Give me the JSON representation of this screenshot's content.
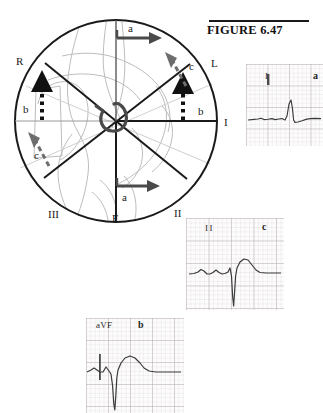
{
  "figure": {
    "title": "FIGURE 6.47"
  },
  "hexaxial": {
    "name": "hexaxial-reference-circle",
    "axis_labels": [
      {
        "id": "R",
        "label": "R",
        "x": 14,
        "y": 56
      },
      {
        "id": "L",
        "label": "L",
        "x": 208,
        "y": 58
      },
      {
        "id": "I",
        "label": "I",
        "x": 222,
        "y": 115
      },
      {
        "id": "II",
        "label": "II",
        "x": 172,
        "y": 207
      },
      {
        "id": "III",
        "label": "III",
        "x": 46,
        "y": 208
      },
      {
        "id": "F",
        "label": "F",
        "x": 110,
        "y": 213
      }
    ],
    "vectors": [
      {
        "id": "a-top",
        "label": "a",
        "style": "solid-arrow-right",
        "x": 128,
        "y": 26
      },
      {
        "id": "a-bottom",
        "label": "a",
        "style": "solid-arrow-right",
        "x": 121,
        "y": 190
      },
      {
        "id": "b-left",
        "label": "b",
        "style": "dotted-arrow-up",
        "x": 21,
        "y": 101
      },
      {
        "id": "b-right",
        "label": "b",
        "style": "dotted-arrow-up",
        "x": 198,
        "y": 103
      },
      {
        "id": "c-left",
        "label": "c",
        "style": "dashed-arrow-up-left",
        "x": 33,
        "y": 146
      },
      {
        "id": "c-right",
        "label": "c",
        "style": "dashed-arrow-up-left",
        "x": 187,
        "y": 62
      }
    ]
  },
  "ecg_strips": [
    {
      "name": "ecg-strip-lead-i",
      "lead_label": "I",
      "tag": "a",
      "description": "small positive R wave, flat baseline"
    },
    {
      "name": "ecg-strip-lead-ii",
      "lead_label": "II",
      "tag": "c",
      "description": "deep negative QS complex with upright T wave"
    },
    {
      "name": "ecg-strip-lead-avf",
      "lead_label": "aVF",
      "tag": "b",
      "description": "deep negative QS complex, calibration tick, tall T wave"
    }
  ],
  "colors": {
    "ink": "#1a1a1a",
    "heart_outline": "#b9b9b9",
    "grid_minor": "#d9d2d2",
    "grid_major": "#b3a9a9",
    "trace": "#3a3a3a"
  }
}
